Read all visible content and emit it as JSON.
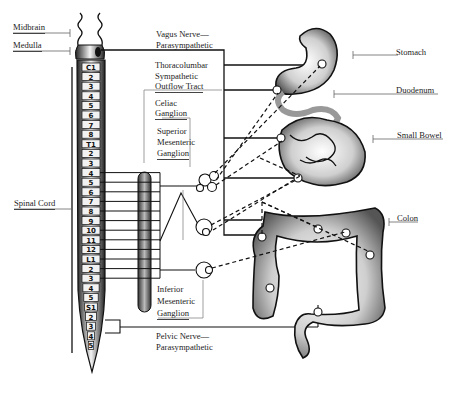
{
  "diagram": {
    "left_labels": {
      "midbrain": "Midbrain",
      "medulla": "Medulla",
      "spinal_cord": "Spinal Cord"
    },
    "center_labels": {
      "vagus_1": "Vagus Nerve—",
      "vagus_2": "Parasympathetic",
      "thoraco_1": "Thoracolumbar",
      "thoraco_2": "Sympathetic",
      "thoraco_3": "Outflow  Tract",
      "celiac_1": "Celiac",
      "celiac_2": "Ganglion",
      "sup_1": "Superior",
      "sup_2": "Mesenteric",
      "sup_3": "Ganglion",
      "inf_1": "Inferior",
      "inf_2": "Mesenteric",
      "inf_3": "Ganglion",
      "pelvic_1": "Pelvic Nerve—",
      "pelvic_2": "Parasympathetic"
    },
    "right_labels": {
      "stomach": "Stomach",
      "duodenum": "Duodenum",
      "small_bowel": "Small Bowel",
      "colon": "Colon"
    },
    "segments": [
      "C1",
      "2",
      "3",
      "4",
      "5",
      "6",
      "7",
      "8",
      "T1",
      "2",
      "3",
      "4",
      "5",
      "6",
      "7",
      "8",
      "9",
      "10",
      "11",
      "12",
      "L1",
      "2",
      "3",
      "4",
      "5",
      "S1",
      "2",
      "3",
      "4",
      "5"
    ],
    "colors": {
      "line": "#1a1a1a",
      "organ_fill": "#d9d9d9",
      "organ_stroke": "#111111"
    }
  }
}
